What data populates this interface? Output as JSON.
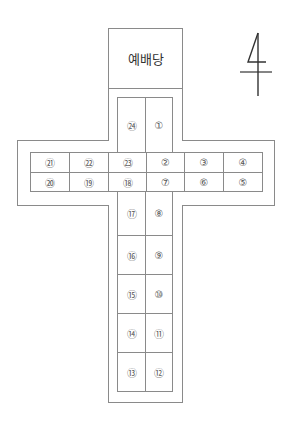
{
  "diagram": {
    "title": "예배당",
    "north_marker": "4",
    "line_color": "#8a8a8a",
    "cells": [
      {
        "id": "c24",
        "label": "㉔",
        "x": 117,
        "y": 97,
        "w": 29,
        "h": 56
      },
      {
        "id": "c1",
        "label": "①",
        "x": 145,
        "y": 97,
        "w": 28,
        "h": 56
      },
      {
        "id": "c21",
        "label": "㉑",
        "x": 30,
        "y": 152,
        "w": 40,
        "h": 21
      },
      {
        "id": "c22",
        "label": "㉒",
        "x": 69,
        "y": 152,
        "w": 40,
        "h": 21
      },
      {
        "id": "c23",
        "label": "㉓",
        "x": 108,
        "y": 152,
        "w": 39,
        "h": 21
      },
      {
        "id": "c2",
        "label": "②",
        "x": 146,
        "y": 152,
        "w": 39,
        "h": 21
      },
      {
        "id": "c3",
        "label": "③",
        "x": 184,
        "y": 152,
        "w": 40,
        "h": 21
      },
      {
        "id": "c4",
        "label": "④",
        "x": 223,
        "y": 152,
        "w": 40,
        "h": 21
      },
      {
        "id": "c20",
        "label": "⑳",
        "x": 30,
        "y": 172,
        "w": 40,
        "h": 20
      },
      {
        "id": "c19",
        "label": "⑲",
        "x": 69,
        "y": 172,
        "w": 40,
        "h": 20
      },
      {
        "id": "c18",
        "label": "⑱",
        "x": 108,
        "y": 172,
        "w": 39,
        "h": 20
      },
      {
        "id": "c7",
        "label": "⑦",
        "x": 146,
        "y": 172,
        "w": 39,
        "h": 20
      },
      {
        "id": "c6",
        "label": "⑥",
        "x": 184,
        "y": 172,
        "w": 40,
        "h": 20
      },
      {
        "id": "c5",
        "label": "⑤",
        "x": 223,
        "y": 172,
        "w": 40,
        "h": 20
      },
      {
        "id": "c17",
        "label": "⑰",
        "x": 117,
        "y": 191,
        "w": 29,
        "h": 45
      },
      {
        "id": "c8",
        "label": "⑧",
        "x": 145,
        "y": 191,
        "w": 28,
        "h": 45
      },
      {
        "id": "c16",
        "label": "⑯",
        "x": 117,
        "y": 235,
        "w": 29,
        "h": 40
      },
      {
        "id": "c9",
        "label": "⑨",
        "x": 145,
        "y": 235,
        "w": 28,
        "h": 40
      },
      {
        "id": "c15",
        "label": "⑮",
        "x": 117,
        "y": 274,
        "w": 29,
        "h": 40
      },
      {
        "id": "c10",
        "label": "⑩",
        "x": 145,
        "y": 274,
        "w": 28,
        "h": 40
      },
      {
        "id": "c14",
        "label": "⑭",
        "x": 117,
        "y": 313,
        "w": 29,
        "h": 40
      },
      {
        "id": "c11",
        "label": "⑪",
        "x": 145,
        "y": 313,
        "w": 28,
        "h": 40
      },
      {
        "id": "c13",
        "label": "⑬",
        "x": 117,
        "y": 352,
        "w": 29,
        "h": 40
      },
      {
        "id": "c12",
        "label": "⑫",
        "x": 145,
        "y": 352,
        "w": 28,
        "h": 40
      }
    ]
  }
}
